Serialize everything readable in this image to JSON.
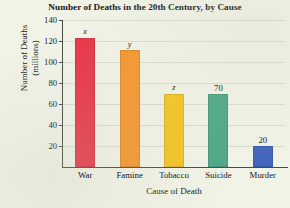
{
  "chart_data": {
    "type": "bar",
    "title": "Number of Deaths in the 20th Century, by Cause",
    "xlabel": "Cause of Death",
    "ylabel_line1": "Number of Deaths",
    "ylabel_line2": "(millions)",
    "categories": [
      "War",
      "Famine",
      "Tobacco",
      "Suicide",
      "Murder"
    ],
    "values": [
      123,
      111,
      70,
      70,
      20
    ],
    "data_labels": [
      "x",
      "y",
      "z",
      "70",
      "20"
    ],
    "data_label_is_variable": [
      true,
      true,
      true,
      false,
      false
    ],
    "bar_colors": [
      "#e8384a",
      "#f5962f",
      "#f5c324",
      "#4fa888",
      "#4365bd"
    ],
    "ylim": [
      0,
      140
    ],
    "yticks": [
      20,
      40,
      60,
      80,
      100,
      120,
      140
    ],
    "ytick_labels": [
      "20",
      "40",
      "60",
      "80",
      "100",
      "120",
      "140"
    ],
    "grid": true,
    "grid_axis": "y",
    "legend": "none",
    "background_color": "#f1f3e7",
    "gridline_color": "#d8dccb",
    "axis_color": "#4a4a46"
  }
}
